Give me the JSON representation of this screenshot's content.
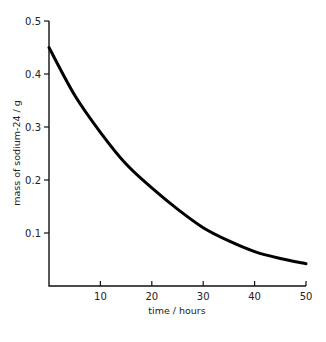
{
  "chart_data": {
    "type": "line",
    "title": "",
    "xlabel": "time / hours",
    "ylabel": "mass of sodium-24 / g",
    "xlim": [
      0,
      50
    ],
    "ylim": [
      0,
      0.5
    ],
    "x_ticks": [
      10,
      20,
      30,
      40,
      50
    ],
    "y_ticks": [
      0.1,
      0.2,
      0.3,
      0.4,
      0.5
    ],
    "x_tick_labels": [
      "10",
      "20",
      "30",
      "40",
      "50"
    ],
    "y_tick_labels": [
      "0.1",
      "0.2",
      "0.3",
      "0.4",
      "0.5"
    ],
    "grid": false,
    "legend": null,
    "series": [
      {
        "name": "sodium-24 decay",
        "x": [
          0,
          5,
          10,
          15,
          20,
          25,
          30,
          35,
          40,
          45,
          50
        ],
        "y": [
          0.45,
          0.36,
          0.29,
          0.23,
          0.185,
          0.145,
          0.11,
          0.085,
          0.065,
          0.052,
          0.042
        ]
      }
    ]
  }
}
